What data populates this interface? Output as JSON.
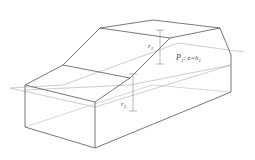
{
  "diagram": {
    "plane_label": {
      "name": "P",
      "sub": "1",
      "eq": ": z=h",
      "eq_sub": "1"
    },
    "marker_top": {
      "name": "r",
      "sub": "1"
    },
    "marker_bottom": {
      "name": "r",
      "sub": "2"
    },
    "colors": {
      "edge": "#555555",
      "plane": "#aaaaaa",
      "hidden": "#bbbbbb",
      "marker": "#888888"
    }
  }
}
